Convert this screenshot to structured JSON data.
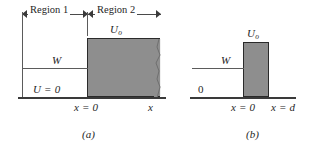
{
  "figure": {
    "type": "physics-potential-energy-diagram",
    "background_color": "#ffffff",
    "ink_color": "#2b2b2b",
    "block_fill_color": "#8e8e8e",
    "block_outline_color": "#2a2a2a"
  },
  "panel_a": {
    "caption": "(a)",
    "region_left_label": "Region 1",
    "region_right_label": "Region 2",
    "potential_step_label": "U",
    "potential_step_sub": "o",
    "energy_label": "W",
    "zero_potential_label": "U = 0",
    "x_origin_label": "x = 0",
    "x_far_label": "x"
  },
  "panel_b": {
    "caption": "(b)",
    "barrier_label": "U",
    "barrier_sub": "o",
    "energy_label": "W",
    "zero_label": "0",
    "x_origin_label": "x = 0",
    "x_width_label": "x = d"
  }
}
